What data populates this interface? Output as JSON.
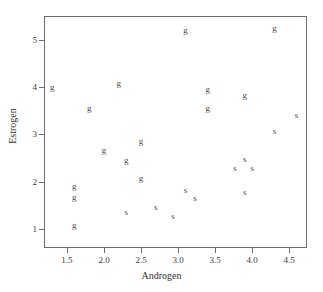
{
  "chart_data": {
    "type": "scatter",
    "title": "",
    "xlabel": "Androgen",
    "ylabel": "Estrogen",
    "xlim": [
      1.19,
      4.74
    ],
    "ylim": [
      0.6,
      5.5
    ],
    "grid": false,
    "legend": "none",
    "marker_style": "text-letter",
    "xticks": [
      1.5,
      2.0,
      2.5,
      3.0,
      3.5,
      4.0,
      4.5
    ],
    "xticklabels": [
      "1.5",
      "2.0",
      "2.5",
      "3.0",
      "3.5",
      "4.0",
      "4.5"
    ],
    "yticks": [
      1,
      2,
      3,
      4,
      5
    ],
    "yticklabels": [
      "1",
      "2",
      "3",
      "4",
      "5"
    ],
    "series": [
      {
        "name": "g",
        "label": "g",
        "color": "#4a4a4a",
        "points": [
          {
            "x": 1.3,
            "y": 4.0,
            "label": "g"
          },
          {
            "x": 1.6,
            "y": 1.9,
            "label": "g"
          },
          {
            "x": 1.6,
            "y": 1.68,
            "label": "g"
          },
          {
            "x": 1.6,
            "y": 1.08,
            "label": "g"
          },
          {
            "x": 1.8,
            "y": 3.55,
            "label": "g"
          },
          {
            "x": 2.0,
            "y": 2.67,
            "label": "g"
          },
          {
            "x": 2.2,
            "y": 4.08,
            "label": "g"
          },
          {
            "x": 2.3,
            "y": 2.45,
            "label": "g"
          },
          {
            "x": 2.5,
            "y": 2.85,
            "label": "g"
          },
          {
            "x": 2.5,
            "y": 2.07,
            "label": "g"
          },
          {
            "x": 3.1,
            "y": 5.2,
            "label": "g"
          },
          {
            "x": 3.4,
            "y": 3.95,
            "label": "g"
          },
          {
            "x": 3.4,
            "y": 3.55,
            "label": "g"
          },
          {
            "x": 3.9,
            "y": 3.83,
            "label": "g"
          },
          {
            "x": 4.3,
            "y": 5.25,
            "label": "g"
          }
        ]
      },
      {
        "name": "s",
        "label": "s",
        "color": "#4a4a4a",
        "points": [
          {
            "x": 2.3,
            "y": 1.35,
            "label": "s"
          },
          {
            "x": 2.7,
            "y": 1.47,
            "label": "s"
          },
          {
            "x": 2.93,
            "y": 1.27,
            "label": "s"
          },
          {
            "x": 3.1,
            "y": 1.82,
            "label": "s"
          },
          {
            "x": 3.23,
            "y": 1.65,
            "label": "s"
          },
          {
            "x": 3.77,
            "y": 2.28,
            "label": "s"
          },
          {
            "x": 3.9,
            "y": 2.48,
            "label": "s"
          },
          {
            "x": 3.9,
            "y": 1.78,
            "label": "s"
          },
          {
            "x": 4.0,
            "y": 2.28,
            "label": "s"
          },
          {
            "x": 4.3,
            "y": 3.07,
            "label": "s"
          },
          {
            "x": 4.6,
            "y": 3.4,
            "label": "s"
          }
        ]
      }
    ]
  }
}
